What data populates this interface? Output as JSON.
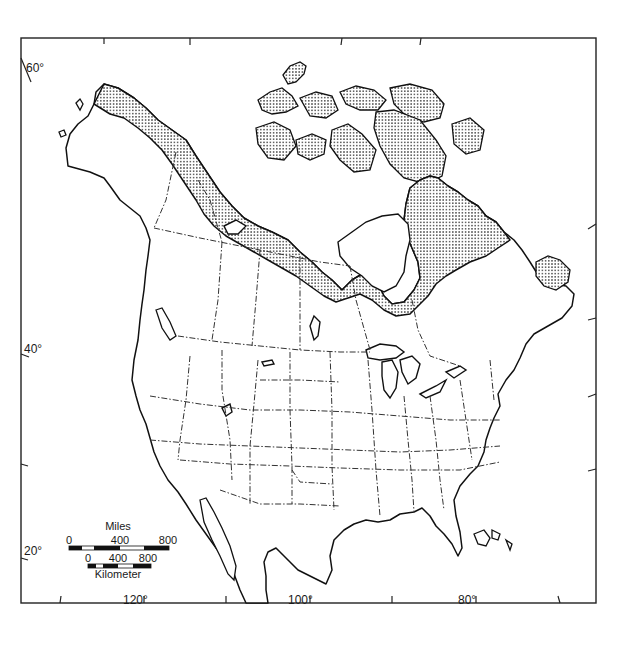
{
  "map": {
    "title": "",
    "latitude_labels": [
      {
        "label": "60°",
        "y": 62
      },
      {
        "label": "40°",
        "y": 350
      },
      {
        "label": "20°",
        "y": 550
      }
    ],
    "longitude_labels": [
      {
        "label": "120°",
        "x": 141
      },
      {
        "label": "100°",
        "x": 300
      },
      {
        "label": "80°",
        "x": 466
      }
    ],
    "stipple_region": "Arctic / tundra region (stippled)",
    "colors": {
      "line": "#111111",
      "background": "#ffffff",
      "stipple": "#222222"
    }
  },
  "scale_bar": {
    "miles": {
      "title": "Miles",
      "ticks": [
        "0",
        "400",
        "800"
      ]
    },
    "km": {
      "title": "Kilometer",
      "ticks": [
        "0",
        "400",
        "800"
      ]
    }
  }
}
